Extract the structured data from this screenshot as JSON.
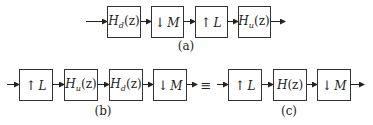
{
  "diagram": {
    "rows": {
      "a": {
        "caption": "(a)",
        "blocks": [
          {
            "id": "Hd",
            "label_main": "H",
            "label_sub": "d",
            "label_arg": "(z)",
            "type": "filter"
          },
          {
            "id": "down",
            "label_arrow": "↓",
            "label_main": "M",
            "type": "downsampler"
          },
          {
            "id": "up",
            "label_arrow": "↑",
            "label_main": "L",
            "type": "upsampler"
          },
          {
            "id": "Hu",
            "label_main": "H",
            "label_sub": "u",
            "label_arg": "(z)",
            "type": "filter"
          }
        ]
      },
      "b": {
        "caption": "(b)",
        "blocks": [
          {
            "id": "up",
            "label_arrow": "↑",
            "label_main": "L",
            "type": "upsampler"
          },
          {
            "id": "Hu",
            "label_main": "H",
            "label_sub": "u",
            "label_arg": "(z)",
            "type": "filter"
          },
          {
            "id": "Hd",
            "label_main": "H",
            "label_sub": "d",
            "label_arg": "(z)",
            "type": "filter"
          },
          {
            "id": "down",
            "label_arrow": "↓",
            "label_main": "M",
            "type": "downsampler"
          }
        ]
      },
      "c": {
        "caption": "(c)",
        "blocks": [
          {
            "id": "up",
            "label_arrow": "↑",
            "label_main": "L",
            "type": "upsampler"
          },
          {
            "id": "H",
            "label_main": "H",
            "label_arg": "(z)",
            "type": "filter"
          },
          {
            "id": "down",
            "label_arrow": "↓",
            "label_main": "M",
            "type": "downsampler"
          }
        ]
      }
    },
    "equivalence_symbol": "≡"
  }
}
